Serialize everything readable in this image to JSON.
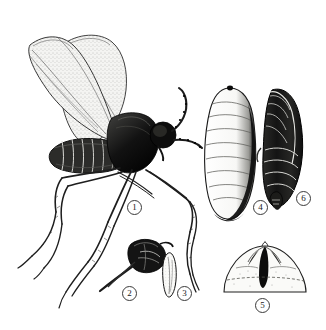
{
  "plate": {
    "kind": "scientific-illustration",
    "subject": "fly life-stages plate",
    "background_color": "#ffffff",
    "ink_color": "#1a1a1a",
    "line_color": "#3a3a3a",
    "wing_fill": "#f2f2f0",
    "body_fill": "#fbfbfa"
  },
  "labels": [
    {
      "id": "1",
      "text": "1",
      "x": 127,
      "y": 200,
      "refers_to": "adult-fly"
    },
    {
      "id": "2",
      "text": "2",
      "x": 122,
      "y": 286,
      "refers_to": "head-mouthparts-detail"
    },
    {
      "id": "3",
      "text": "3",
      "x": 177,
      "y": 286,
      "refers_to": "elongate-appendage-detail"
    },
    {
      "id": "4",
      "text": "4",
      "x": 253,
      "y": 200,
      "refers_to": "larva"
    },
    {
      "id": "5",
      "text": "5",
      "x": 255,
      "y": 298,
      "refers_to": "posterior-segment-detail"
    },
    {
      "id": "6",
      "text": "6",
      "x": 296,
      "y": 191,
      "refers_to": "pupa"
    }
  ],
  "figures": [
    {
      "name": "adult-fly",
      "label": "1"
    },
    {
      "name": "head-detail",
      "label": "2"
    },
    {
      "name": "appendage-detail",
      "label": "3"
    },
    {
      "name": "larva",
      "label": "4"
    },
    {
      "name": "posterior-detail",
      "label": "5"
    },
    {
      "name": "pupa",
      "label": "6"
    }
  ]
}
